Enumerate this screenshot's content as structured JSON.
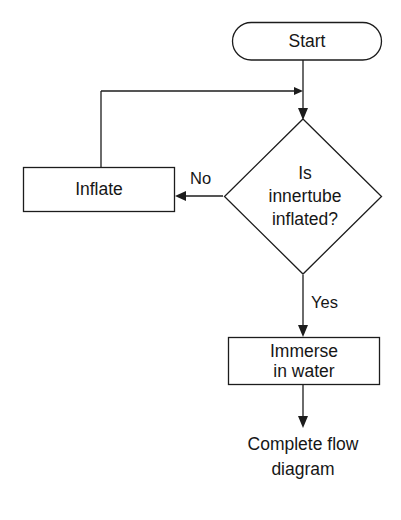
{
  "diagram": {
    "background_color": "#ffffff",
    "stroke_color": "#1c1c1c",
    "text_color": "#161616",
    "nodes": {
      "start": {
        "label": "Start",
        "shape": "stadium"
      },
      "decision": {
        "shape": "diamond",
        "line1": "Is",
        "line2": "innertube",
        "line3": "inflated?"
      },
      "inflate": {
        "label": "Inflate",
        "shape": "rectangle"
      },
      "immerse": {
        "shape": "rectangle",
        "line1": "Immerse",
        "line2": "in water"
      },
      "complete": {
        "shape": "text",
        "line1": "Complete flow",
        "line2": "diagram"
      }
    },
    "edges": {
      "no_label": "No",
      "yes_label": "Yes"
    }
  },
  "footer": {
    "ghost_text": ""
  }
}
